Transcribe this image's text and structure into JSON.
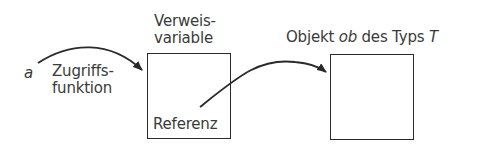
{
  "diagram": {
    "variable_label": "a",
    "access_label_line1": "Zugriffs-",
    "access_label_line2": "funktion",
    "ref_var_title_line1": "Verweis-",
    "ref_var_title_line2": "variable",
    "ref_var_content": "Referenz",
    "object_title_prefix": "Objekt ",
    "object_title_name": "ob",
    "object_title_middle": " des Typs ",
    "object_title_type": "T"
  },
  "colors": {
    "stroke": "#2a2a2a",
    "text": "#3a3a3a",
    "background": "#ffffff"
  }
}
